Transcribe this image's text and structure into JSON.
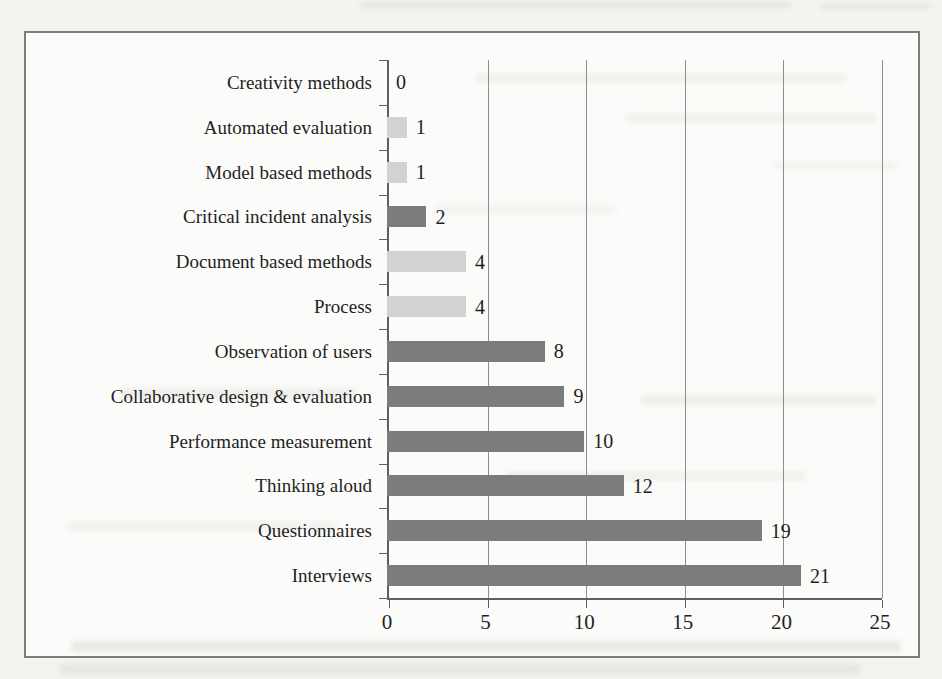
{
  "chart_data": {
    "type": "bar",
    "orientation": "horizontal",
    "title": "",
    "xlabel": "",
    "ylabel": "",
    "categories": [
      "Creativity methods",
      "Automated evaluation",
      "Model based methods",
      "Critical incident analysis",
      "Document based methods",
      "Process",
      "Observation of users",
      "Collaborative design & evaluation",
      "Performance measurement",
      "Thinking aloud",
      "Questionnaires",
      "Interviews"
    ],
    "values": [
      0,
      1,
      1,
      2,
      4,
      4,
      8,
      9,
      10,
      12,
      19,
      21
    ],
    "value_labels": [
      "0",
      "1",
      "1",
      "2",
      "4",
      "4",
      "8",
      "9",
      "10",
      "12",
      "19",
      "21"
    ],
    "bar_shades": [
      "none",
      "light",
      "light",
      "dark",
      "light",
      "light",
      "dark",
      "dark",
      "dark",
      "dark",
      "dark",
      "dark"
    ],
    "xlim": [
      0,
      25
    ],
    "x_ticks": [
      0,
      5,
      10,
      15,
      20,
      25
    ],
    "x_tick_labels": [
      "0",
      "5",
      "10",
      "15",
      "20",
      "25"
    ],
    "gridlines": {
      "vertical_at": [
        5,
        10,
        15,
        20,
        25
      ],
      "horizontal": false
    },
    "legend": "none",
    "colors": {
      "dark_bar": "#7c7c7c",
      "light_bar": "#d2d2d2",
      "gridline": "#8e8e8e",
      "axis": "#5f5f5f",
      "text": "#1f1f1f",
      "box_border": "#7d7d7d",
      "paper": "#fbfbf9",
      "page_background": "#f4f3ef"
    }
  }
}
